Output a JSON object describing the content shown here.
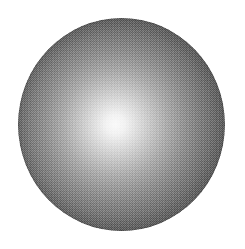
{
  "figure": {
    "kind": "shaded-sphere",
    "canvas": {
      "width_px": 245,
      "height_px": 249,
      "background_color": "#ffffff"
    },
    "sphere": {
      "name": "sphere",
      "left_px": 18,
      "top_px": 18,
      "width_px": 207,
      "height_px": 213,
      "center_x_px": 121,
      "center_y_px": 124,
      "radius_x_px": 104,
      "radius_y_px": 106
    },
    "highlight": {
      "name": "specular-highlight",
      "center_x_px": 115,
      "center_y_px": 125,
      "center_x_pct": 47,
      "center_y_pct": 50,
      "core_color": "#fbfbfb",
      "core_radius_pct": 6
    },
    "shading": {
      "type": "radial-gradient",
      "stops": [
        {
          "offset_pct": 0,
          "color": "#fbfbfb"
        },
        {
          "offset_pct": 6,
          "color": "#f4f4f4"
        },
        {
          "offset_pct": 13,
          "color": "#e4e4e4"
        },
        {
          "offset_pct": 22,
          "color": "#cfcfcf"
        },
        {
          "offset_pct": 32,
          "color": "#b8b8b8"
        },
        {
          "offset_pct": 44,
          "color": "#a0a0a0"
        },
        {
          "offset_pct": 56,
          "color": "#8a8a8a"
        },
        {
          "offset_pct": 68,
          "color": "#757575"
        },
        {
          "offset_pct": 80,
          "color": "#646464"
        },
        {
          "offset_pct": 90,
          "color": "#585858"
        },
        {
          "offset_pct": 100,
          "color": "#4d4d4d"
        }
      ],
      "limb_color": "#4a4a4a",
      "texture": "halftone-dither-checkerboard"
    }
  }
}
